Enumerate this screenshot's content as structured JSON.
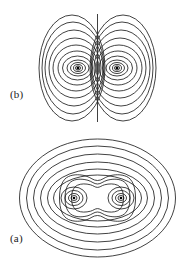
{
  "figure": {
    "background_color": "#ffffff",
    "stroke_color": "#111111",
    "width": 189,
    "height": 267
  },
  "panels": [
    {
      "id": "panel-b",
      "label": "(b)",
      "label_x": 10,
      "label_y": 88,
      "description": "two-lobe contour map with central vertical separatrix",
      "center_x": 97.5,
      "center_y": 68,
      "separatrix": {
        "x": 97.5,
        "y_top": 14,
        "y_bottom": 122
      },
      "foci": [
        {
          "x": 73,
          "y": 68
        },
        {
          "x": 122,
          "y": 68
        }
      ],
      "lobe_rings": [
        {
          "rx": 7,
          "ry": 5
        },
        {
          "rx": 11,
          "ry": 8
        },
        {
          "rx": 15,
          "ry": 12
        },
        {
          "rx": 19,
          "ry": 17
        },
        {
          "rx": 23,
          "ry": 23
        },
        {
          "rx": 26,
          "ry": 30
        },
        {
          "rx": 29,
          "ry": 38
        },
        {
          "rx": 31,
          "ry": 46
        },
        {
          "rx": 33,
          "ry": 53
        }
      ]
    },
    {
      "id": "panel-a",
      "label": "(a)",
      "label_x": 10,
      "label_y": 232,
      "description": "nested elliptical contours enclosing a peanut-shaped inner contour around two foci",
      "center_x": 97.5,
      "center_y": 198,
      "foci": [
        {
          "x": 74,
          "y": 198
        },
        {
          "x": 121,
          "y": 198
        }
      ],
      "inner_rings": [
        {
          "rx": 5,
          "ry": 4
        },
        {
          "rx": 9,
          "ry": 7
        },
        {
          "rx": 13,
          "ry": 11
        }
      ],
      "outer_rings": [
        {
          "rx": 44,
          "ry": 23
        },
        {
          "rx": 50,
          "ry": 29
        },
        {
          "rx": 57,
          "ry": 36
        },
        {
          "rx": 64,
          "ry": 44
        },
        {
          "rx": 71,
          "ry": 52
        },
        {
          "rx": 78,
          "ry": 59
        }
      ],
      "peanut_waist_ratio": 0.42
    }
  ],
  "chart_data": {
    "type": "line",
    "title": "",
    "subtitle": "",
    "xlabel": "",
    "ylabel": "",
    "grid": false,
    "legend_position": "none",
    "annotations": [
      "(a)",
      "(b)"
    ],
    "series": [
      {
        "name": "panel-b-left-lobe",
        "kind": "closed-contours",
        "center": [
          73,
          68
        ],
        "levels": [
          1,
          2,
          3,
          4,
          5,
          6,
          7,
          8,
          9
        ],
        "semi_axes": [
          [
            7,
            5
          ],
          [
            11,
            8
          ],
          [
            15,
            12
          ],
          [
            19,
            17
          ],
          [
            23,
            23
          ],
          [
            26,
            30
          ],
          [
            29,
            38
          ],
          [
            31,
            46
          ],
          [
            33,
            53
          ]
        ]
      },
      {
        "name": "panel-b-right-lobe",
        "kind": "closed-contours",
        "center": [
          122,
          68
        ],
        "levels": [
          1,
          2,
          3,
          4,
          5,
          6,
          7,
          8,
          9
        ],
        "semi_axes": [
          [
            7,
            5
          ],
          [
            11,
            8
          ],
          [
            15,
            12
          ],
          [
            19,
            17
          ],
          [
            23,
            23
          ],
          [
            26,
            30
          ],
          [
            29,
            38
          ],
          [
            31,
            46
          ],
          [
            33,
            53
          ]
        ]
      },
      {
        "name": "panel-b-separatrix",
        "kind": "straight-line",
        "x": [
          97.5,
          97.5
        ],
        "y": [
          14,
          122
        ]
      },
      {
        "name": "panel-a-left-focus-rings",
        "kind": "closed-contours",
        "center": [
          74,
          198
        ],
        "levels": [
          1,
          2,
          3
        ],
        "semi_axes": [
          [
            5,
            4
          ],
          [
            9,
            7
          ],
          [
            13,
            11
          ]
        ]
      },
      {
        "name": "panel-a-right-focus-rings",
        "kind": "closed-contours",
        "center": [
          121,
          198
        ],
        "levels": [
          1,
          2,
          3
        ],
        "semi_axes": [
          [
            5,
            4
          ],
          [
            9,
            7
          ],
          [
            13,
            11
          ]
        ]
      },
      {
        "name": "panel-a-peanut-contours",
        "kind": "dumbbell-contours",
        "center": [
          97.5,
          198
        ],
        "levels": [
          4,
          5,
          6
        ],
        "waist_ratio": 0.42
      },
      {
        "name": "panel-a-outer-ellipses",
        "kind": "closed-contours",
        "center": [
          97.5,
          198
        ],
        "levels": [
          7,
          8,
          9,
          10,
          11,
          12
        ],
        "semi_axes": [
          [
            44,
            23
          ],
          [
            50,
            29
          ],
          [
            57,
            36
          ],
          [
            64,
            44
          ],
          [
            71,
            52
          ],
          [
            78,
            59
          ]
        ]
      }
    ],
    "xlim": [
      0,
      189
    ],
    "ylim": [
      267,
      0
    ]
  }
}
